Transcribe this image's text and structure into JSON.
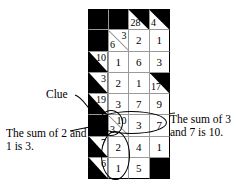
{
  "figure": {
    "type": "kakuro-puzzle-diagram",
    "title": "",
    "grid": {
      "columns": 4,
      "rows": 8,
      "cells": [
        [
          {
            "kind": "black"
          },
          {
            "kind": "black"
          },
          {
            "kind": "clue",
            "down": "28",
            "across": ""
          },
          {
            "kind": "clue",
            "down": "4",
            "across": ""
          }
        ],
        [
          {
            "kind": "black"
          },
          {
            "kind": "split",
            "down": "6",
            "across": "3"
          },
          {
            "kind": "value",
            "value": "2"
          },
          {
            "kind": "value",
            "value": "1"
          }
        ],
        [
          {
            "kind": "clue",
            "down": "",
            "across": "10"
          },
          {
            "kind": "value",
            "value": "1"
          },
          {
            "kind": "value",
            "value": "6"
          },
          {
            "kind": "value",
            "value": "3"
          }
        ],
        [
          {
            "kind": "clue",
            "down": "",
            "across": "3"
          },
          {
            "kind": "value",
            "value": "2"
          },
          {
            "kind": "value",
            "value": "1"
          },
          {
            "kind": "clue",
            "down": "17",
            "across": ""
          }
        ],
        [
          {
            "kind": "clue",
            "down": "",
            "across": "19"
          },
          {
            "kind": "value",
            "value": "3"
          },
          {
            "kind": "value",
            "value": "7"
          },
          {
            "kind": "value",
            "value": "9"
          }
        ],
        [
          {
            "kind": "black"
          },
          {
            "kind": "split",
            "down": "3",
            "across": "10"
          },
          {
            "kind": "value",
            "value": "3"
          },
          {
            "kind": "value",
            "value": "7"
          }
        ],
        [
          {
            "kind": "clue",
            "down": "",
            "across": "7"
          },
          {
            "kind": "value",
            "value": "2"
          },
          {
            "kind": "value",
            "value": "4"
          },
          {
            "kind": "value",
            "value": "1"
          }
        ],
        [
          {
            "kind": "clue",
            "down": "",
            "across": "6"
          },
          {
            "kind": "value",
            "value": "1"
          },
          {
            "kind": "value",
            "value": "5"
          },
          {
            "kind": "black"
          }
        ]
      ]
    },
    "annotations": {
      "clue_label": "Clue",
      "left_note": "The sum of 2 and 1 is 3.",
      "right_note": "The sum of 3 and 7 is 10."
    },
    "highlights": {
      "horizontal_ellipse": "3 and 7 across",
      "vertical_ellipse": "3, 2, 1 down",
      "clue_ellipse": "10"
    },
    "colors": {
      "ink": "#000000",
      "paper": "#ffffff",
      "gridline": "#9a9a9a"
    }
  }
}
